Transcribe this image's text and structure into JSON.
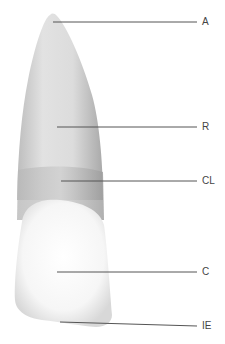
{
  "diagram": {
    "labels": [
      {
        "key": "A",
        "text": "A",
        "line": {
          "x1": 53,
          "y1": 22,
          "x2": 197,
          "y2": 22
        },
        "label_x": 202,
        "label_y": 17
      },
      {
        "key": "R",
        "text": "R",
        "line": {
          "x1": 57,
          "y1": 127,
          "x2": 197,
          "y2": 127
        },
        "label_x": 202,
        "label_y": 122
      },
      {
        "key": "CL",
        "text": "CL",
        "line": {
          "x1": 61,
          "y1": 181,
          "x2": 197,
          "y2": 181
        },
        "label_x": 202,
        "label_y": 176
      },
      {
        "key": "C",
        "text": "C",
        "line": {
          "x1": 57,
          "y1": 272,
          "x2": 197,
          "y2": 272
        },
        "label_x": 202,
        "label_y": 267
      },
      {
        "key": "IE",
        "text": "IE",
        "line": {
          "x1": 60,
          "y1": 322,
          "x2": 197,
          "y2": 326
        },
        "label_x": 202,
        "label_y": 321
      }
    ]
  }
}
